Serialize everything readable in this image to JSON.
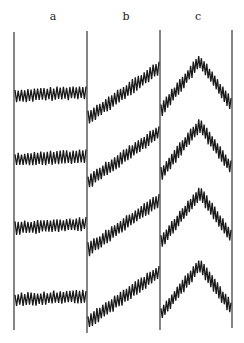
{
  "figure": {
    "panel_labels": [
      "a",
      "b",
      "c"
    ],
    "label_x": [
      52,
      125,
      197
    ],
    "divider_x": [
      14,
      87,
      160,
      232
    ],
    "divider_top": [
      32,
      31,
      30,
      30
    ],
    "divider_bottom": [
      330,
      333,
      330,
      328
    ],
    "trace_color": "#1a1a1a",
    "rows_baseline_y": [
      96,
      160,
      228,
      300
    ],
    "panels": [
      {
        "shape": "flat",
        "start_offset": 0,
        "end_offset": -4,
        "amplitude": 13,
        "cycles": 22
      },
      {
        "shape": "ramp_up",
        "start_offset": 22,
        "end_offset": -28,
        "amplitude": 14,
        "cycles": 24
      },
      {
        "shape": "peak",
        "start_offset": 14,
        "peak_offset": -35,
        "end_offset": 8,
        "amplitude": 14,
        "cycles": 26
      }
    ]
  }
}
